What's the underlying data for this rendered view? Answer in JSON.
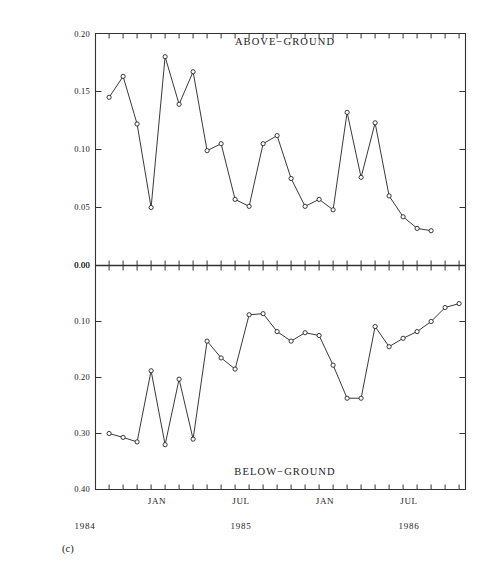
{
  "figure": {
    "subfigure_label": "(c)",
    "y_axis_title_main": "RELATIVE RATE OF DECOMPOSITION (g g",
    "y_axis_title_exp1": "−1",
    "y_axis_title_mid": " month ",
    "y_axis_title_exp2": "−1",
    "y_axis_title_close": ")"
  },
  "chart_data": {
    "type": "line",
    "title": "",
    "xlabel": "",
    "ylabel": "RELATIVE RATE OF DECOMPOSITION (g g^-1 month^-1)",
    "grid": false,
    "legend": "none",
    "marker": "open-circle",
    "line_color": "#222222",
    "x_tick_interval_months": 1,
    "x_axis_labels": [
      {
        "label": "JAN",
        "month_index": 4
      },
      {
        "label": "JUL",
        "month_index": 10
      },
      {
        "label": "JAN",
        "month_index": 16
      },
      {
        "label": "JUL",
        "month_index": 22
      }
    ],
    "x_year_labels": [
      {
        "label": "1984",
        "month_index": 0
      },
      {
        "label": "1985",
        "month_index": 10
      },
      {
        "label": "1986",
        "month_index": 22
      }
    ],
    "panels": [
      {
        "name": "above-ground",
        "title": "ABOVE−GROUND",
        "ylim": [
          0.0,
          0.2
        ],
        "y_ticks": [
          "0.20",
          "0.15",
          "0.10",
          "0.05",
          "0.00"
        ],
        "y_tick_values": [
          0.2,
          0.15,
          0.1,
          0.05,
          0.0
        ],
        "y_inverted": false,
        "x": [
          0,
          1,
          2,
          3,
          4,
          5,
          6,
          7,
          8,
          9,
          10,
          11,
          12,
          13,
          14,
          15,
          16,
          17,
          18,
          19,
          20,
          21,
          22,
          23,
          24,
          25
        ],
        "values": [
          0.145,
          0.163,
          0.122,
          0.05,
          0.18,
          0.139,
          0.167,
          0.099,
          0.105,
          0.057,
          0.051,
          0.105,
          0.112,
          0.075,
          0.051,
          0.057,
          0.048,
          0.132,
          0.076,
          0.123,
          0.06,
          0.042,
          0.032,
          0.03,
          null,
          null
        ]
      },
      {
        "name": "below-ground",
        "title": "BELOW−GROUND",
        "ylim": [
          0.0,
          0.4
        ],
        "y_ticks": [
          "0.00",
          "0.10",
          "0.20",
          "0.30",
          "0.40"
        ],
        "y_tick_values": [
          0.0,
          0.1,
          0.2,
          0.3,
          0.4
        ],
        "y_inverted": true,
        "x": [
          0,
          1,
          2,
          3,
          4,
          5,
          6,
          7,
          8,
          9,
          10,
          11,
          12,
          13,
          14,
          15,
          16,
          17,
          18,
          19,
          20,
          21,
          22,
          23,
          24,
          25
        ],
        "values": [
          0.3,
          0.307,
          0.315,
          0.188,
          0.32,
          0.203,
          0.31,
          0.135,
          0.165,
          0.185,
          0.088,
          0.086,
          0.118,
          0.135,
          0.12,
          0.125,
          0.178,
          0.237,
          0.237,
          0.109,
          0.145,
          0.13,
          0.118,
          0.1,
          0.075,
          0.068
        ]
      }
    ]
  }
}
